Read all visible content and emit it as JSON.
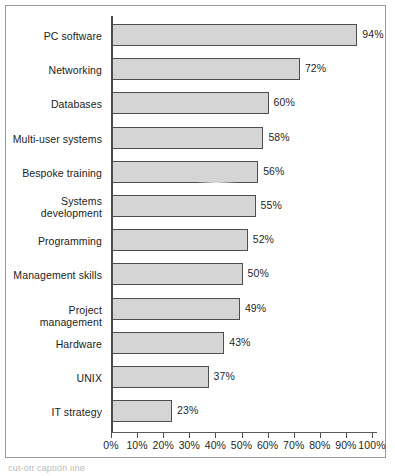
{
  "chart_data": {
    "type": "bar",
    "orientation": "horizontal",
    "title": "",
    "xlabel": "",
    "ylabel": "",
    "xlim": [
      0,
      100
    ],
    "xtick_labels": [
      "0%",
      "10%",
      "20%",
      "30%",
      "40%",
      "50%",
      "60%",
      "70%",
      "80%",
      "90%",
      "100%"
    ],
    "xticks": [
      0,
      10,
      20,
      30,
      40,
      50,
      60,
      70,
      80,
      90,
      100
    ],
    "grid": false,
    "legend": "none",
    "categories": [
      "PC software",
      "Networking",
      "Databases",
      "Multi-user systems",
      "Bespoke training",
      "Systems development",
      "Programming",
      "Management skills",
      "Project management",
      "Hardware",
      "UNIX",
      "IT strategy"
    ],
    "values": [
      94,
      72,
      60,
      58,
      56,
      55,
      52,
      50,
      49,
      43,
      37,
      23
    ],
    "value_labels": [
      "94%",
      "72%",
      "60%",
      "58%",
      "56%",
      "55%",
      "52%",
      "50%",
      "49%",
      "43%",
      "37%",
      "23%"
    ],
    "bar_fill_color": "#d5d5d5",
    "bar_border_color": "#4e4e4e",
    "axis_color": "#4a4a4a",
    "text_color": "#1f1f1f"
  },
  "caption": {
    "text": "cut-off caption line"
  }
}
